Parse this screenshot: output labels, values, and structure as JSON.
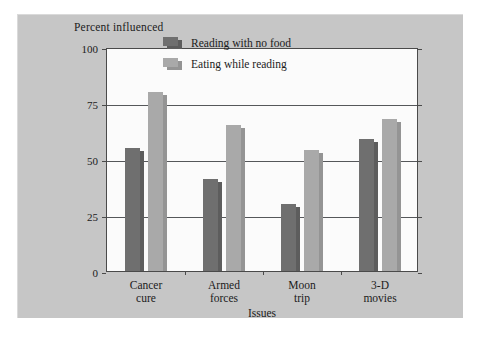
{
  "chart_data": {
    "type": "bar",
    "title": "",
    "ylabel": "Percent influenced",
    "xlabel": "Issues",
    "categories": [
      "Cancer\ncure",
      "Armed\nforces",
      "Moon\ntrip",
      "3-D\nmovies"
    ],
    "category_lines": [
      [
        "Cancer",
        "cure"
      ],
      [
        "Armed",
        "forces"
      ],
      [
        "Moon",
        "trip"
      ],
      [
        "3-D",
        "movies"
      ]
    ],
    "series": [
      {
        "name": "Reading with no food",
        "color": "#6f6f6f",
        "values": [
          55,
          41,
          30,
          59
        ]
      },
      {
        "name": "Eating while reading",
        "color": "#a9a9a9",
        "values": [
          80,
          65,
          54,
          68
        ]
      }
    ],
    "ylim": [
      0,
      100
    ],
    "yticks": [
      0,
      25,
      50,
      75,
      100
    ],
    "ytick_labels": [
      "0",
      "25",
      "50",
      "75",
      "100"
    ],
    "grid": "horizontal",
    "legend_position": "upper-right-inside"
  },
  "legend": {
    "items": [
      {
        "label": "Reading with no food",
        "style": "dark"
      },
      {
        "label": "Eating while reading",
        "style": "light"
      }
    ]
  },
  "colors": {
    "panel_background": "#c6c6c6",
    "plot_background": "#fbfbfb",
    "axis": "#4a4a4a",
    "gridline": "#55575a",
    "series_dark": "#6f6f6f",
    "series_light": "#a9a9a9",
    "text": "#1b1b1b"
  }
}
